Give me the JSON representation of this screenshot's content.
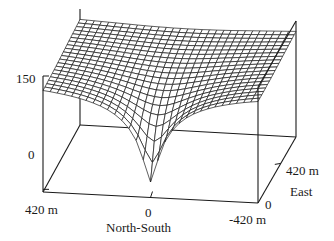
{
  "chart_data": {
    "type": "surface3d",
    "title": "",
    "z_axis": {
      "ticks": [
        "150",
        "0"
      ],
      "range": [
        0,
        150
      ]
    },
    "x_axis": {
      "label": "North-South",
      "ticks": [
        "420 m",
        "0",
        "-420 m"
      ],
      "range": [
        420,
        -420
      ]
    },
    "y_axis": {
      "label": "East",
      "ticks": [
        "0",
        "420 m"
      ],
      "range": [
        0,
        420
      ]
    },
    "grid": {
      "ns_lines": 31,
      "east_lines": 21
    },
    "surface": {
      "model": "z = zmax - depth * f(r), cone-like minimum at (NS=0, E=0)",
      "zmax": 150,
      "min_value_approx": 20,
      "center": {
        "ns": 0,
        "east": 0
      }
    },
    "line_color": "#1a1a1a",
    "background": "#ffffff"
  },
  "labels": {
    "z_top": "150",
    "z_bottom": "0",
    "ns_left": "420 m",
    "ns_mid": "0",
    "ns_right": "-420 m",
    "ns_title": "North-South",
    "east_zero": "0",
    "east_far": "420 m",
    "east_title": "East"
  }
}
